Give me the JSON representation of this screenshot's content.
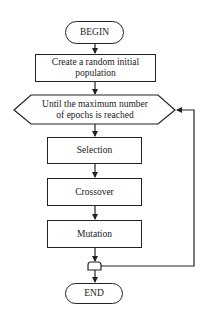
{
  "diagram": {
    "type": "flowchart",
    "nodes": [
      {
        "id": "begin",
        "shape": "terminal",
        "label": "BEGIN"
      },
      {
        "id": "init",
        "shape": "process",
        "label": "Create a random initial population"
      },
      {
        "id": "loop",
        "shape": "loop-hexagon",
        "label": "Until the maximum number of epochs is reached"
      },
      {
        "id": "selection",
        "shape": "process",
        "label": "Selection"
      },
      {
        "id": "crossover",
        "shape": "process",
        "label": "Crossover"
      },
      {
        "id": "mutation",
        "shape": "process",
        "label": "Mutation"
      },
      {
        "id": "junction",
        "shape": "connector",
        "label": ""
      },
      {
        "id": "end",
        "shape": "terminal",
        "label": "END"
      }
    ],
    "edges": [
      {
        "from": "begin",
        "to": "init"
      },
      {
        "from": "init",
        "to": "loop"
      },
      {
        "from": "loop",
        "to": "selection"
      },
      {
        "from": "selection",
        "to": "crossover"
      },
      {
        "from": "crossover",
        "to": "mutation"
      },
      {
        "from": "mutation",
        "to": "junction"
      },
      {
        "from": "junction",
        "to": "loop",
        "note": "loop-back"
      },
      {
        "from": "junction",
        "to": "end"
      }
    ]
  },
  "labels": {
    "begin": "BEGIN",
    "init_line1": "Create a random initial",
    "init_line2": "population",
    "loop_line1": "Until the maximum number",
    "loop_line2": "of epochs is reached",
    "selection": "Selection",
    "crossover": "Crossover",
    "mutation": "Mutation",
    "end": "END"
  }
}
